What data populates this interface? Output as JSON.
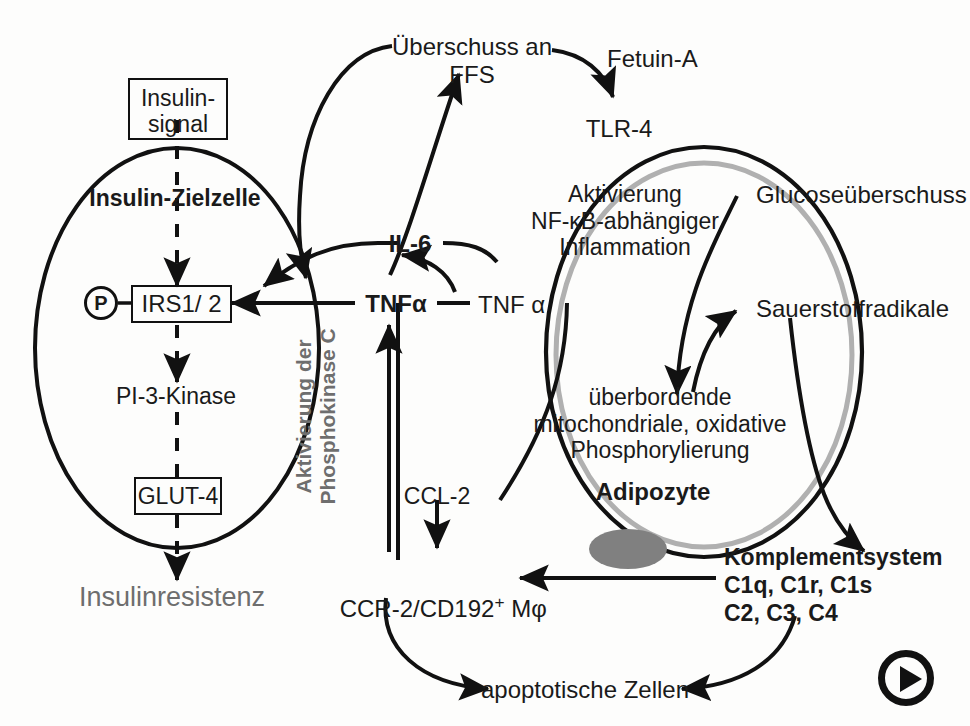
{
  "figure": {
    "background_color": "#fdfdfc",
    "line_color": "#111111",
    "gray_color": "#6e6e6e",
    "membrane_gray": "#b0b0b0"
  },
  "cells": {
    "insulin_target_cell": {
      "label": "Insulin-Zielzelle"
    },
    "adipocyte": {
      "label": "Adipozyte"
    }
  },
  "boxes": {
    "insulin_signal": "Insulin-\nsignal",
    "irs": "IRS1/ 2",
    "glut4": "GLUT-4"
  },
  "markers": {
    "phospho": "P"
  },
  "labels": {
    "ffs_excess": "Überschuss an\nFFS",
    "fetuin_a": "Fetuin-A",
    "tlr4": "TLR-4",
    "nfkb_activation": "Aktivierung\nNF-κB-abhängiger\nInflammation",
    "glucose_excess": "Glucoseüberschuss",
    "oxygen_radicals": "Sauerstoffradikale",
    "il6": "IL-6",
    "tnfa_left": "TNFα",
    "tnfa_right": "TNF α",
    "pkc_activation": "Aktivierung der\nPhosphokinase C",
    "pi3kinase": "PI-3-Kinase",
    "insulin_resistance": "Insulinresistenz",
    "oxidative_phosphorylation": "überbordende\nmitochondriale, oxidative\nPhosphorylierung",
    "ccl2": "CCL-2",
    "macrophage": "CCR-2/CD192+ Mφ",
    "macrophage_prefix": "CCR-2/CD192",
    "macrophage_superscript": "+",
    "macrophage_suffix": " Mφ",
    "complement_system": "Komplementsystem\nC1q, C1r, C1s\nC2, C3, C4",
    "apoptotic_cells": "apoptotische Zellen"
  },
  "controls": {
    "play_button": "play-button"
  }
}
